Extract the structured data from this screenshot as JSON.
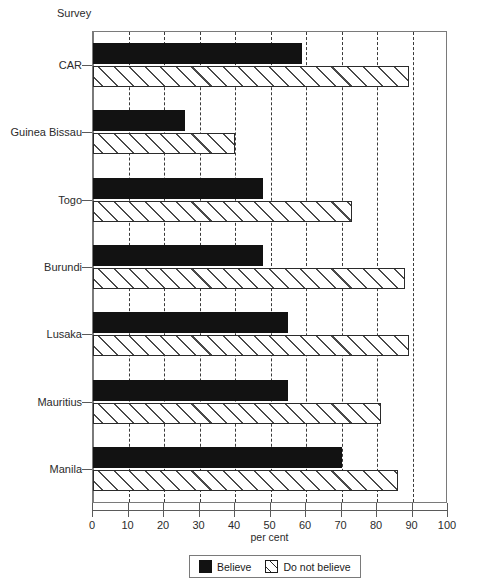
{
  "chart_data": {
    "type": "bar",
    "orientation": "horizontal",
    "title": "",
    "xlabel": "per cent",
    "ylabel": "Survey",
    "xlim": [
      0,
      100
    ],
    "xticks": [
      0,
      10,
      20,
      30,
      40,
      50,
      60,
      70,
      80,
      90,
      100
    ],
    "xtick_labels": [
      "0",
      "10",
      "20",
      "30",
      "40",
      "50",
      "60",
      "70",
      "80",
      "90",
      "100"
    ],
    "grid": "vertical-dashed",
    "legend_position": "bottom-center",
    "categories": [
      "CAR",
      "Guinea Bissau",
      "Togo",
      "Burundi",
      "Lusaka",
      "Mauritius",
      "Manila"
    ],
    "series": [
      {
        "name": "Believe",
        "color": "#121212",
        "pattern": "solid",
        "values": [
          59,
          26,
          48,
          48,
          55,
          55,
          70
        ]
      },
      {
        "name": "Do not believe",
        "color": "#ffffff",
        "pattern": "diagonal-hatch",
        "values": [
          89,
          40,
          73,
          88,
          89,
          81,
          86
        ]
      }
    ]
  },
  "legend": {
    "items": [
      {
        "label": "Believe",
        "swatch": "solid-black-square"
      },
      {
        "label": "Do not believe",
        "swatch": "hatched-square"
      }
    ]
  }
}
